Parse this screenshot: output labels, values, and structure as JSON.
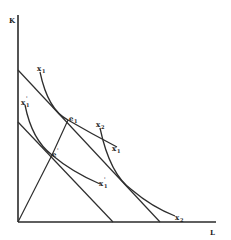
{
  "diagram": {
    "axes": {
      "y_label": "K",
      "x_label": "L"
    },
    "isoquants": [
      {
        "id": "x1",
        "label": "x",
        "subscript": "1",
        "prime": false
      },
      {
        "id": "x2",
        "label": "x",
        "subscript": "2",
        "prime": false
      },
      {
        "id": "x1_prime",
        "label": "x",
        "subscript": "1",
        "prime": true
      }
    ],
    "isoquant_top_labels": [
      {
        "id": "x1_top",
        "label": "x",
        "subscript": "1"
      },
      {
        "id": "x2_top",
        "label": "x",
        "subscript": "2"
      },
      {
        "id": "x1_prime_top",
        "label": "x",
        "subscript": "1",
        "prime": true
      }
    ],
    "points": [
      {
        "id": "e1",
        "label": "e",
        "subscript": "1"
      },
      {
        "id": "e_prime",
        "label": "e",
        "subscript": "",
        "prime": true
      }
    ],
    "budget_lines": [
      {
        "id": "outer",
        "description": "original isocost line"
      },
      {
        "id": "inner",
        "description": "parallel lower isocost line"
      }
    ],
    "expansion_path": {
      "description": "ray from origin through e' and e1"
    }
  },
  "text": {
    "K": "K",
    "L": "L",
    "x": "x",
    "e": "e",
    "sub1": "1",
    "sub2": "2",
    "prime": "'"
  }
}
